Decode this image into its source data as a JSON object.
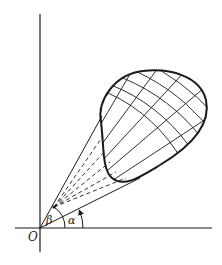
{
  "figure": {
    "type": "polar-region-sketch",
    "labels": {
      "origin": "O",
      "alpha": "α",
      "beta": "β"
    },
    "colors": {
      "ink": "#1a1a1a",
      "background": "#ffffff"
    },
    "elements": {
      "axes": [
        "x-axis",
        "y-axis"
      ],
      "region": "closed curve with curvilinear grid (polar mesh)",
      "bounding_rays": 2,
      "interior_dashed_rays": 5,
      "angle_arcs": [
        "alpha",
        "beta"
      ]
    }
  }
}
